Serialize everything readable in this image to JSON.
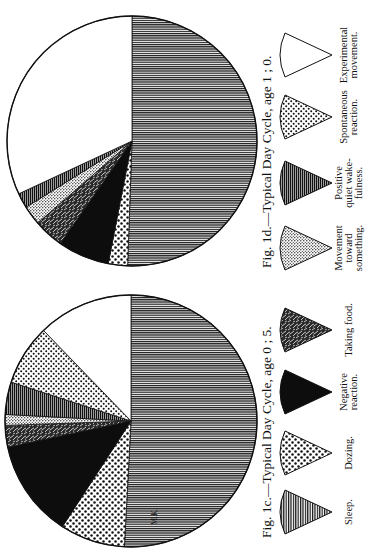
{
  "chart_data": [
    {
      "type": "pie",
      "title": "Fig. 1c.—Typical Day Cycle, age 0 ; 5.",
      "figure_label": "Fig. 1c.",
      "age": "0 ; 5",
      "unit": "degrees of 360 (share of 24-hour day)",
      "categories": [
        "Sleep",
        "Dozing",
        "Negative reaction",
        "Taking food",
        "Movement toward something",
        "Positive quiet wakefulness",
        "Spontaneous reaction",
        "Experimental movement"
      ],
      "values": [
        183,
        30,
        45,
        10,
        5,
        15,
        28,
        44
      ],
      "start_angle_deg": 0,
      "direction": "clockwise",
      "position": "lower"
    },
    {
      "type": "pie",
      "title": "Fig. 1d.—Typical Day Cycle, age 1 ; 0.",
      "figure_label": "Fig. 1d.",
      "age": "1 ; 0",
      "unit": "degrees of 360 (share of 24-hour day)",
      "categories": [
        "Sleep",
        "Dozing",
        "Negative reaction",
        "Taking food",
        "Movement toward something",
        "Positive quiet wakefulness",
        "Spontaneous reaction",
        "Experimental movement"
      ],
      "values": [
        182,
        9,
        24,
        14,
        9,
        7,
        0,
        115
      ],
      "start_angle_deg": 0,
      "direction": "clockwise",
      "position": "upper"
    }
  ],
  "captions": {
    "fig_1c": "Fig. 1c.—Typical Day Cycle, age 0 ; 5.",
    "fig_1d": "Fig. 1d.—Typical Day Cycle, age 1 ; 0."
  },
  "legend": {
    "items": [
      {
        "key": "sleep",
        "label_lines": [
          "Sleep."
        ],
        "pattern": "fine-lines"
      },
      {
        "key": "dozing",
        "label_lines": [
          "Dozing."
        ],
        "pattern": "sparse-dots"
      },
      {
        "key": "negative",
        "label_lines": [
          "Negative",
          "reaction."
        ],
        "pattern": "solid-black"
      },
      {
        "key": "food",
        "label_lines": [
          "Taking food."
        ],
        "pattern": "dark-scribble"
      },
      {
        "key": "toward",
        "label_lines": [
          "Movement",
          "toward",
          "something."
        ],
        "pattern": "fine-stipple"
      },
      {
        "key": "quiet",
        "label_lines": [
          "Positive",
          "quiet wake-",
          "fulness."
        ],
        "pattern": "dark-lines"
      },
      {
        "key": "spontaneous",
        "label_lines": [
          "Spontaneous",
          "reaction."
        ],
        "pattern": "medium-dots"
      },
      {
        "key": "experimental",
        "label_lines": [
          "Experimental",
          "movement."
        ],
        "pattern": "blank"
      }
    ]
  },
  "mark": "M.K."
}
